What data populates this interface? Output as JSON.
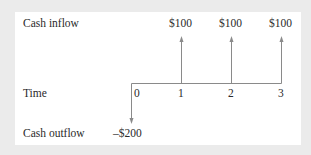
{
  "diagram": {
    "type": "cash-flow-timeline",
    "row_labels": {
      "inflow": "Cash inflow",
      "time": "Time",
      "outflow": "Cash outflow"
    },
    "periods": [
      "0",
      "1",
      "2",
      "3"
    ],
    "inflows": [
      {
        "period": "1",
        "label": "$100"
      },
      {
        "period": "2",
        "label": "$100"
      },
      {
        "period": "3",
        "label": "$100"
      }
    ],
    "outflows": [
      {
        "period": "0",
        "label": "–$200"
      }
    ],
    "colors": {
      "background": "#ebebeb",
      "panel": "#ffffff",
      "line": "#8a8a8a",
      "text": "#2a2a2a"
    }
  }
}
